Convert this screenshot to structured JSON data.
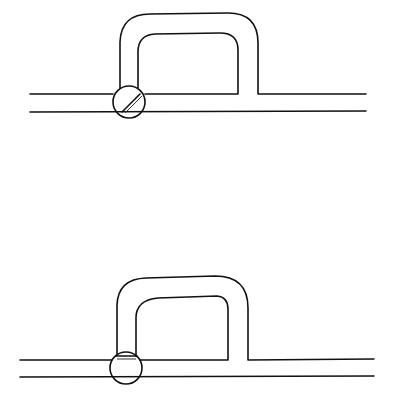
{
  "diagram": {
    "type": "pipe-bypass-loop",
    "panels": [
      {
        "id": "top",
        "valve_state": "open-diagonal",
        "description": "Bypass loop on pipe with valve in circle, disc rotated diagonally"
      },
      {
        "id": "bottom",
        "valve_state": "closed-horizontal",
        "description": "Bypass loop on pipe with valve in circle, disc horizontal across loop inlet"
      }
    ],
    "colors": {
      "line": "#111111",
      "background": "#ffffff"
    }
  }
}
